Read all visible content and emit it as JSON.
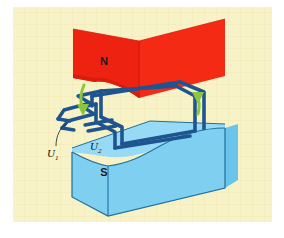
{
  "figure": {
    "background_color": "#f7f2c8",
    "canvas_color": "#ffffff",
    "grid_color": "#eee7b4"
  },
  "magnets": {
    "north": {
      "label": "N",
      "color": "#ee2211",
      "shade_color": "#d91c0c",
      "outline_color": "#c41608",
      "description": "upper red magnet pole with concave lower face"
    },
    "south": {
      "label": "S",
      "color": "#7fd0f0",
      "top_color": "#96daf5",
      "side_color": "#69c5ea",
      "outline_color": "#1f6f9e",
      "description": "lower blue magnet pole with saddle shaped upper face"
    }
  },
  "coil": {
    "wire_color": "#1e5590",
    "wire_highlight": "#3f7bb8",
    "description": "dark blue rectangular wire loop with zigzag lead wires"
  },
  "arrows": {
    "color": "#8cc63f",
    "stroke_color": "#6fa22c",
    "left": {
      "name": "current-arrow-left",
      "direction": "down"
    },
    "right": {
      "name": "current-arrow-right",
      "direction": "down"
    }
  },
  "labels": {
    "u1": {
      "symbol": "U",
      "subscript": "1"
    },
    "u2": {
      "symbol": "U",
      "subscript": "2"
    }
  }
}
